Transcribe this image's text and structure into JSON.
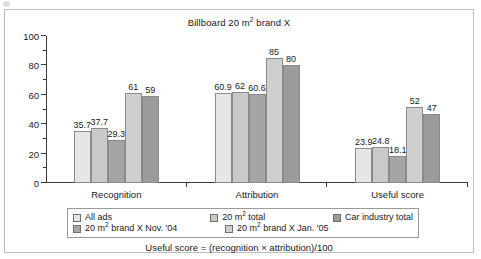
{
  "figure": {
    "caption": "Useful score = (recognition × attribution)/100"
  },
  "chart_data": {
    "type": "bar",
    "title": "Billboard 20 m2 brand X",
    "title_parts": {
      "before": "Billboard 20 m",
      "sup": "2",
      "after": " brand X"
    },
    "xlabel": "",
    "ylabel": "",
    "ylim": [
      0,
      100
    ],
    "yticks": [
      0,
      20,
      40,
      60,
      80,
      100
    ],
    "ytick_labels": [
      "0",
      "20",
      "40",
      "60",
      "80",
      "100"
    ],
    "yminor_ticks": [
      10,
      30,
      50,
      70,
      90
    ],
    "grid": false,
    "legend_position": "below-axes",
    "categories": [
      "Recognition",
      "Attribution",
      "Useful score"
    ],
    "series": [
      {
        "name": "All ads",
        "color": "#e6e6e6",
        "values": [
          35.7,
          60.9,
          23.9
        ],
        "labels": [
          "35.7",
          "60.9",
          "23.9"
        ]
      },
      {
        "name": "20 m2 total",
        "color": "#c9c9c9",
        "values": [
          37.7,
          62,
          24.8
        ],
        "labels": [
          "37.7",
          "62",
          "24.8"
        ]
      },
      {
        "name": "20 m2 brand X Nov. '04",
        "color": "#a5a5a5",
        "values": [
          29.3,
          60.6,
          18.1
        ],
        "labels": [
          "29.3",
          "60.6",
          "18.1"
        ]
      },
      {
        "name": "20 m2 brand X Jan. '05",
        "color": "#cfcfcf",
        "values": [
          61,
          85,
          52
        ],
        "labels": [
          "61",
          "85",
          "52"
        ]
      },
      {
        "name": "Car industry total",
        "color": "#9b9b9b",
        "values": [
          59,
          80,
          47
        ],
        "labels": [
          "59",
          "80",
          "47"
        ]
      }
    ]
  },
  "legend": {
    "items": [
      {
        "label_before": "All ads",
        "label_sup": "",
        "label_after": "",
        "color": "#e6e6e6"
      },
      {
        "label_before": "20 m",
        "label_sup": "2",
        "label_after": " total",
        "color": "#c9c9c9"
      },
      {
        "label_before": "Car industry total",
        "label_sup": "",
        "label_after": "",
        "color": "#9b9b9b"
      },
      {
        "label_before": "20 m",
        "label_sup": "2",
        "label_after": " brand X Nov. '04",
        "color": "#a5a5a5"
      },
      {
        "label_before": "20 m",
        "label_sup": "2",
        "label_after": " brand X Jan. '05",
        "color": "#cfcfcf"
      }
    ]
  }
}
